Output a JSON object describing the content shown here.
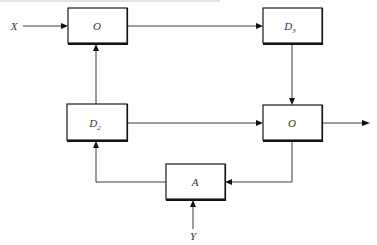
{
  "diagram": {
    "blocks": [
      {
        "id": "o_top",
        "label": "O",
        "sub": ""
      },
      {
        "id": "d3",
        "label": "D",
        "sub": "3"
      },
      {
        "id": "d2",
        "label": "D",
        "sub": "2"
      },
      {
        "id": "o_mid",
        "label": "O",
        "sub": ""
      },
      {
        "id": "a",
        "label": "A",
        "sub": ""
      }
    ],
    "inputs": {
      "x": "X",
      "y": "Y"
    },
    "edges": [
      {
        "from": "X",
        "to": "o_top"
      },
      {
        "from": "o_top",
        "to": "d3"
      },
      {
        "from": "d3",
        "to": "o_mid"
      },
      {
        "from": "d2",
        "to": "o_top"
      },
      {
        "from": "d2",
        "to": "o_mid"
      },
      {
        "from": "o_mid",
        "to": "output"
      },
      {
        "from": "o_mid",
        "to": "a"
      },
      {
        "from": "a",
        "to": "d2"
      },
      {
        "from": "Y",
        "to": "a"
      }
    ]
  }
}
